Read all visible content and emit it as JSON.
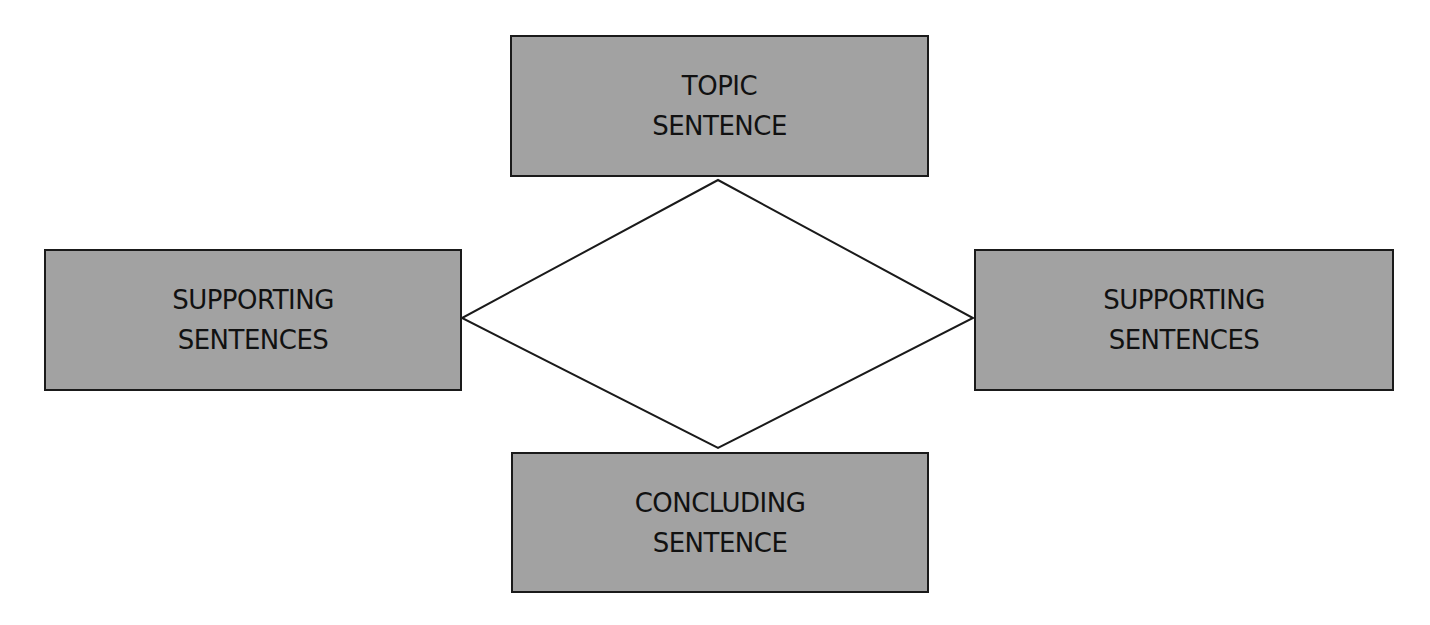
{
  "diagram": {
    "background": "#ffffff",
    "box_fill": "#a2a2a2",
    "stroke": "#1a1a1a",
    "nodes": [
      {
        "id": "topic",
        "lines": [
          "TOPIC",
          "SENTENCE"
        ]
      },
      {
        "id": "supporting-left",
        "lines": [
          "SUPPORTING",
          "SENTENCES"
        ]
      },
      {
        "id": "supporting-right",
        "lines": [
          "SUPPORTING",
          "SENTENCES"
        ]
      },
      {
        "id": "concluding",
        "lines": [
          "CONCLUDING",
          "SENTENCE"
        ]
      }
    ],
    "connector": {
      "shape": "diamond",
      "vertices": {
        "top": [
          718,
          180
        ],
        "right": [
          973,
          318
        ],
        "bottom": [
          718,
          448
        ],
        "left": [
          462,
          318
        ]
      }
    }
  }
}
